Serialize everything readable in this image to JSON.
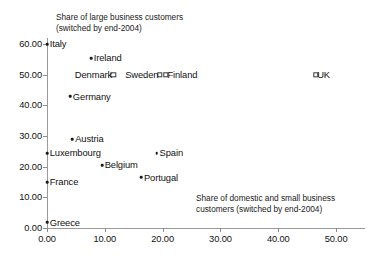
{
  "chart_data": {
    "type": "scatter",
    "title": "",
    "xlabel": "Share of domestic and small business\ncustomers (switched by end-2004)",
    "ylabel": "Share of large business customers\n(switched by end-2004)",
    "xlim": [
      0,
      55
    ],
    "ylim": [
      0,
      62
    ],
    "grid": false,
    "legend": "none",
    "xticks": [
      "0.00",
      "10.00",
      "20.00",
      "30.00",
      "40.00",
      "50.00"
    ],
    "xtick_values": [
      0,
      10,
      20,
      30,
      40,
      50
    ],
    "yticks": [
      "0.00",
      "10.00",
      "20.00",
      "30.00",
      "40.00",
      "50.00",
      "60.00"
    ],
    "ytick_values": [
      0,
      10,
      20,
      30,
      40,
      50,
      60
    ],
    "points": [
      {
        "label": "Italy",
        "x": 0.0,
        "y": 60.0,
        "marker": "dot",
        "label_side": "right"
      },
      {
        "label": "Ireland",
        "x": 7.6,
        "y": 55.5,
        "marker": "dot",
        "label_side": "right"
      },
      {
        "label": "Denmark",
        "x": 11.5,
        "y": 50.0,
        "marker": "square",
        "label_side": "left"
      },
      {
        "label": "Sweden",
        "x": 19.5,
        "y": 50.0,
        "marker": "square",
        "label_side": "left"
      },
      {
        "label": "Finland",
        "x": 20.6,
        "y": 50.0,
        "marker": "square",
        "label_side": "right"
      },
      {
        "label": "UK",
        "x": 46.5,
        "y": 50.0,
        "marker": "square",
        "label_side": "right"
      },
      {
        "label": "Germany",
        "x": 4.0,
        "y": 43.0,
        "marker": "dot",
        "label_side": "right"
      },
      {
        "label": "Austria",
        "x": 4.4,
        "y": 29.0,
        "marker": "dot",
        "label_side": "right"
      },
      {
        "label": "Luxembourg",
        "x": 0.0,
        "y": 24.5,
        "marker": "dot",
        "label_side": "right"
      },
      {
        "label": "Spain",
        "x": 19.0,
        "y": 24.5,
        "marker": "dot",
        "label_side": "right"
      },
      {
        "label": "Belgium",
        "x": 9.5,
        "y": 20.5,
        "marker": "dot",
        "label_side": "right"
      },
      {
        "label": "Portugal",
        "x": 16.3,
        "y": 16.5,
        "marker": "dot",
        "label_side": "right"
      },
      {
        "label": "France",
        "x": 0.0,
        "y": 15.0,
        "marker": "dot",
        "label_side": "right"
      },
      {
        "label": "Greece",
        "x": 0.0,
        "y": 1.8,
        "marker": "dot",
        "label_side": "right"
      }
    ]
  }
}
